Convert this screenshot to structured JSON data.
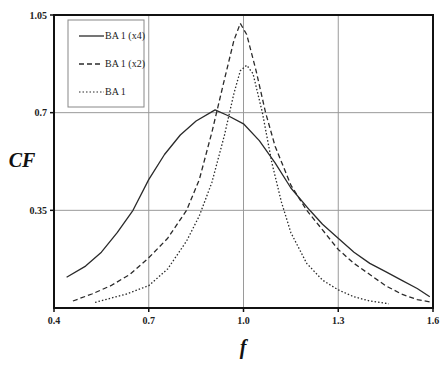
{
  "chart_data": {
    "type": "line",
    "title": "",
    "xlabel": "f",
    "ylabel": "CF",
    "xlim": [
      0.4,
      1.6
    ],
    "ylim": [
      0,
      1.05
    ],
    "xticks": [
      "0.4",
      "0.7",
      "1.0",
      "1.3",
      "1.6"
    ],
    "xtick_values": [
      0.4,
      0.7,
      1.0,
      1.3,
      1.6
    ],
    "yticks": [
      "0.35",
      "0.7",
      "1.05"
    ],
    "ytick_values": [
      0.35,
      0.7,
      1.05
    ],
    "grid": true,
    "legend_position": "upper-left",
    "series": [
      {
        "name": "BA 1 (x4)",
        "style": "solid",
        "x": [
          0.44,
          0.5,
          0.55,
          0.6,
          0.65,
          0.7,
          0.75,
          0.8,
          0.85,
          0.91,
          0.95,
          1.0,
          1.05,
          1.1,
          1.15,
          1.21,
          1.25,
          1.3,
          1.35,
          1.4,
          1.45,
          1.5,
          1.55,
          1.59
        ],
        "values": [
          0.11,
          0.15,
          0.2,
          0.27,
          0.35,
          0.46,
          0.55,
          0.62,
          0.67,
          0.71,
          0.69,
          0.66,
          0.6,
          0.52,
          0.43,
          0.35,
          0.3,
          0.25,
          0.2,
          0.16,
          0.13,
          0.1,
          0.07,
          0.04
        ]
      },
      {
        "name": "BA 1 (x2)",
        "style": "dashed",
        "x": [
          0.46,
          0.52,
          0.58,
          0.64,
          0.7,
          0.76,
          0.82,
          0.86,
          0.9,
          0.94,
          0.97,
          0.99,
          1.01,
          1.04,
          1.07,
          1.1,
          1.15,
          1.2,
          1.25,
          1.3,
          1.35,
          1.4,
          1.45,
          1.5,
          1.55,
          1.6
        ],
        "values": [
          0.025,
          0.05,
          0.08,
          0.12,
          0.18,
          0.25,
          0.35,
          0.46,
          0.63,
          0.82,
          0.96,
          1.02,
          0.98,
          0.85,
          0.7,
          0.58,
          0.44,
          0.35,
          0.28,
          0.21,
          0.16,
          0.12,
          0.08,
          0.05,
          0.03,
          0.02
        ]
      },
      {
        "name": "BA 1",
        "style": "dotted",
        "x": [
          0.53,
          0.58,
          0.63,
          0.7,
          0.76,
          0.82,
          0.86,
          0.9,
          0.94,
          0.97,
          0.99,
          1.01,
          1.03,
          1.06,
          1.09,
          1.12,
          1.15,
          1.2,
          1.25,
          1.3,
          1.35,
          1.4,
          1.46
        ],
        "values": [
          0.02,
          0.035,
          0.05,
          0.08,
          0.14,
          0.24,
          0.33,
          0.45,
          0.62,
          0.77,
          0.85,
          0.87,
          0.84,
          0.7,
          0.52,
          0.38,
          0.27,
          0.16,
          0.1,
          0.065,
          0.04,
          0.025,
          0.015
        ]
      }
    ]
  },
  "legend": {
    "items": [
      {
        "label": "BA 1 (x4)",
        "style": "solid"
      },
      {
        "label": "BA 1 (x2)",
        "style": "dashed"
      },
      {
        "label": "BA 1",
        "style": "dotted"
      }
    ]
  },
  "colors": {
    "line": "#2a2a2a",
    "grid": "#9a9a9a",
    "axis": "#111111"
  }
}
